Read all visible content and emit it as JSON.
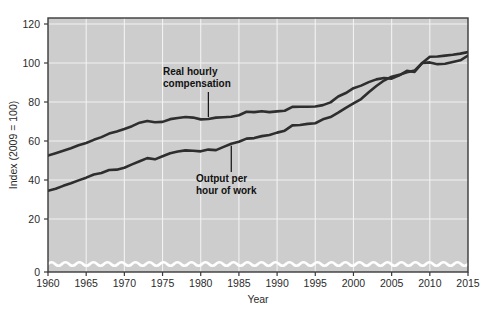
{
  "chart_data": {
    "type": "line",
    "title": "",
    "xlabel": "Year",
    "ylabel": "Index (2009 = 100)",
    "xlim": [
      1960,
      2015
    ],
    "ylim": [
      0,
      120
    ],
    "y_axis_break": true,
    "y_break_note": "axis broken between 0 and ~12 (wavy line)",
    "grid": true,
    "legend_position": "inline-annotations",
    "xticks": [
      1960,
      1965,
      1970,
      1975,
      1980,
      1985,
      1990,
      1995,
      2000,
      2005,
      2010,
      2015
    ],
    "yticks": [
      0,
      20,
      40,
      60,
      80,
      100,
      120
    ],
    "x": [
      1960,
      1961,
      1962,
      1963,
      1964,
      1965,
      1966,
      1967,
      1968,
      1969,
      1970,
      1971,
      1972,
      1973,
      1974,
      1975,
      1976,
      1977,
      1978,
      1979,
      1980,
      1981,
      1982,
      1983,
      1984,
      1985,
      1986,
      1987,
      1988,
      1989,
      1990,
      1991,
      1992,
      1993,
      1994,
      1995,
      1996,
      1997,
      1998,
      1999,
      2000,
      2001,
      2002,
      2003,
      2004,
      2005,
      2006,
      2007,
      2008,
      2009,
      2010,
      2011,
      2012,
      2013,
      2014,
      2015
    ],
    "series": [
      {
        "name": "Real hourly compensation",
        "color": "#2e2e2e",
        "values": [
          52.5,
          53.7,
          55.0,
          56.3,
          57.8,
          59.0,
          60.6,
          62.0,
          63.8,
          64.9,
          66.2,
          67.6,
          69.4,
          70.3,
          69.6,
          69.8,
          71.2,
          71.8,
          72.3,
          72.0,
          71.1,
          71.3,
          72.0,
          72.2,
          72.4,
          73.2,
          75.0,
          74.8,
          75.3,
          74.8,
          75.2,
          75.5,
          77.5,
          77.6,
          77.6,
          77.7,
          78.4,
          79.8,
          82.8,
          84.6,
          87.1,
          88.4,
          90.2,
          91.6,
          92.3,
          92.0,
          93.7,
          96.0,
          95.4,
          100.0,
          100.3,
          99.4,
          99.6,
          100.5,
          101.4,
          103.8
        ]
      },
      {
        "name": "Output per hour of work",
        "color": "#2e2e2e",
        "values": [
          34.5,
          35.5,
          37.0,
          38.3,
          39.8,
          41.2,
          42.8,
          43.6,
          45.1,
          45.3,
          46.3,
          48.0,
          49.6,
          51.2,
          50.6,
          52.2,
          53.7,
          54.6,
          55.2,
          55.0,
          54.7,
          55.6,
          55.3,
          57.0,
          58.6,
          59.6,
          61.2,
          61.5,
          62.5,
          63.1,
          64.3,
          65.3,
          68.0,
          68.2,
          68.8,
          69.1,
          71.1,
          72.3,
          74.5,
          77.0,
          79.3,
          81.5,
          85.0,
          88.2,
          91.0,
          93.0,
          93.9,
          95.3,
          96.1,
          100.0,
          103.2,
          103.3,
          103.8,
          104.2,
          104.8,
          105.6
        ]
      }
    ],
    "annotations": [
      {
        "label_line1": "Real hourly",
        "label_line2": "compensation",
        "points_to_year": 1981,
        "points_to_value": 71.3
      },
      {
        "label_line1": "Output per",
        "label_line2": "hour of work",
        "points_to_year": 1984,
        "points_to_value": 58.6
      }
    ],
    "colors": {
      "plot_background": "#cdcdcd",
      "gridline": "#f2f2f2",
      "line": "#2e2e2e",
      "axis": "#3a3a3a",
      "text": "#2b2b2b",
      "page_background": "#ffffff"
    }
  }
}
